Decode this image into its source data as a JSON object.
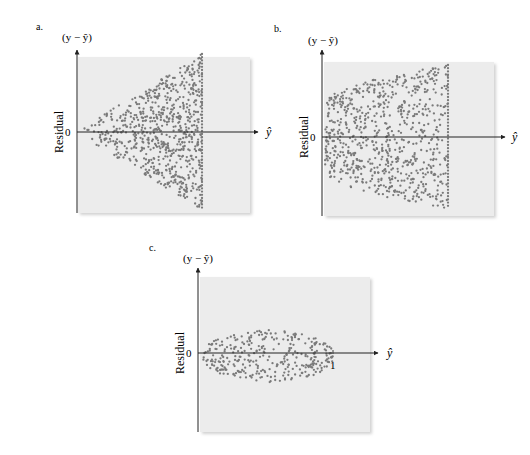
{
  "chart_data": [
    {
      "id": "a",
      "type": "scatter",
      "panel_label": "a.",
      "title": "",
      "y_axis_title": "(y − ŷ)",
      "ylabel": "Residual",
      "xlabel": "ŷ",
      "y_zero_label": "0",
      "pattern": "funnel widening to the right (variance increases with ŷ)",
      "grid": false,
      "legend": null,
      "background": "#ececec",
      "dot_color": "#7a7a7a",
      "layout": {
        "frame": [
          78,
          57,
          250,
          213
        ],
        "axis_x": 77,
        "axis_top": 50,
        "axis_bottom": 213,
        "zero_y": 132,
        "arrow_end": 258,
        "yhat_x": 266,
        "ylabel_x": 63
      },
      "shape": {
        "x_start": 82,
        "x_end": 202,
        "half_width_start": 4,
        "half_width_end": 78,
        "profile": "linear",
        "n_points": 720,
        "seed": 11
      }
    },
    {
      "id": "b",
      "type": "scatter",
      "panel_label": "b.",
      "title": "",
      "y_axis_title": "(y − ŷ)",
      "ylabel": "Residual",
      "xlabel": "ŷ",
      "y_zero_label": "0",
      "pattern": "curved (parabolic) envelope, spread grows then levels off",
      "grid": false,
      "legend": null,
      "background": "#ececec",
      "dot_color": "#7a7a7a",
      "layout": {
        "frame": [
          324,
          62,
          494,
          216
        ],
        "axis_x": 322,
        "axis_top": 50,
        "axis_bottom": 216,
        "zero_y": 137,
        "arrow_end": 505,
        "yhat_x": 512,
        "ylabel_x": 308
      },
      "shape": {
        "x_start": 325,
        "x_end": 448,
        "half_width_start": 32,
        "half_width_end": 72,
        "profile": "sqrt",
        "n_points": 760,
        "seed": 23
      }
    },
    {
      "id": "c",
      "type": "scatter",
      "panel_label": "c.",
      "title": "",
      "y_axis_title": "(y − ŷ)",
      "ylabel": "Residual",
      "xlabel": "ŷ",
      "y_zero_label": "0",
      "x_tick_label": "1",
      "pattern": "football/ellipse shape, bounded between 0 and 1",
      "grid": false,
      "legend": null,
      "background": "#ececec",
      "dot_color": "#7a7a7a",
      "layout": {
        "frame": [
          200,
          277,
          370,
          432
        ],
        "axis_x": 198,
        "axis_top": 268,
        "axis_bottom": 432,
        "zero_y": 353,
        "arrow_end": 378,
        "yhat_x": 387,
        "ylabel_x": 184,
        "tick_x": 333
      },
      "shape": {
        "x_start": 203,
        "x_end": 333,
        "half_width_start": 0,
        "half_width_end": 0,
        "peak_half_width": 27,
        "profile": "ellipse",
        "n_points": 330,
        "seed": 37
      }
    }
  ]
}
